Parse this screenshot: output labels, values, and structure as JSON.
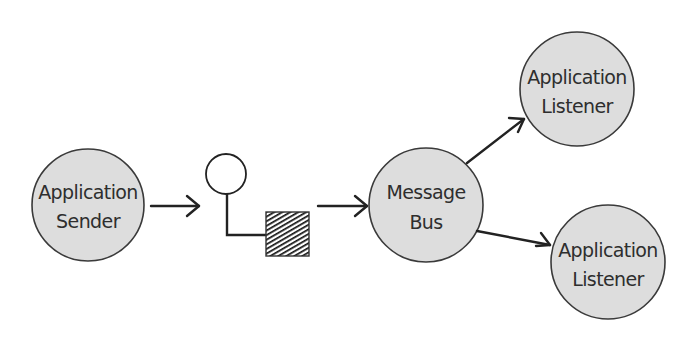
{
  "diagram": {
    "title": "",
    "colors": {
      "node_fill": "#dddddd",
      "node_stroke": "#3a3a3a",
      "text": "#2e2e2e",
      "edge": "#222222",
      "background": "#ffffff"
    },
    "nodes": {
      "sender": {
        "line1": "Application",
        "line2": "Sender"
      },
      "channel_endpoint": {
        "type": "message-endpoint-symbol"
      },
      "bus": {
        "line1": "Message",
        "line2": "Bus"
      },
      "listener_top": {
        "line1": "Application",
        "line2": "Listener"
      },
      "listener_bottom": {
        "line1": "Application",
        "line2": "Listener"
      }
    },
    "edges": [
      {
        "from": "sender",
        "to": "channel_endpoint"
      },
      {
        "from": "channel_endpoint",
        "to": "bus"
      },
      {
        "from": "bus",
        "to": "listener_top"
      },
      {
        "from": "bus",
        "to": "listener_bottom"
      }
    ]
  }
}
